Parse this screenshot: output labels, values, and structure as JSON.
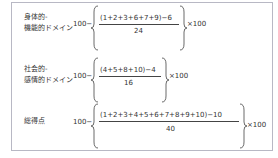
{
  "formulas": [
    {
      "label_lines": [
        "身体的-",
        "機能的ドメイン"
      ],
      "prefix": "100−",
      "numerator": "(1+2+3+6+7+9)−6",
      "denominator": "24",
      "suffix": "×100"
    },
    {
      "label_lines": [
        "社会的-",
        "感情的ドメイン"
      ],
      "prefix": "100−",
      "numerator": "(4+5+8+10)−4",
      "denominator": "16",
      "suffix": "×100"
    },
    {
      "label_lines": [
        "総得点"
      ],
      "prefix": "100−",
      "numerator": "(1+2+3+4+5+6+7+8+9+10)−10",
      "denominator": "40",
      "suffix": "×100"
    }
  ]
}
